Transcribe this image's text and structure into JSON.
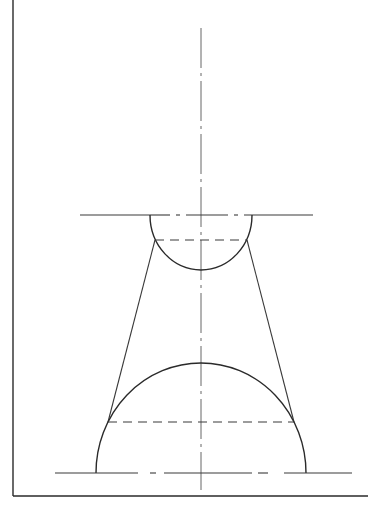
{
  "drawing": {
    "title": "",
    "type": "technical projection drawing - cone frustum tangent to two spheres",
    "colors": {
      "background": "#ffffff",
      "line": "#2a2a2a",
      "centerline": "#555555"
    },
    "frame": {
      "left_x": 13,
      "top_y": 0,
      "bottom_y": 496,
      "right_x": 368
    },
    "axis": {
      "x": 201,
      "y_top": 28,
      "y_bottom": 490,
      "style": "dash-dot"
    },
    "small_sphere": {
      "center_x": 201,
      "center_y": 215,
      "radius": 51,
      "visible": "lower semicircle",
      "base_line": {
        "x1": 80,
        "x2": 313,
        "y": 215,
        "style": "solid ends, dash-dot middle"
      },
      "tangent_chord": {
        "x1": 155,
        "x2": 247,
        "y": 240,
        "style": "dashed"
      }
    },
    "large_sphere": {
      "center_x": 201,
      "center_y": 473,
      "radius": 105,
      "visible": "upper semicircle",
      "base_line": {
        "x1": 55,
        "x2": 352,
        "y": 473,
        "style": "solid ends, dash-dot middle"
      },
      "tangent_chord": {
        "x1": 108,
        "x2": 294,
        "y": 422,
        "style": "dashed"
      }
    },
    "cone_generators": [
      {
        "side": "left",
        "x1": 155,
        "y1": 240,
        "x2": 108,
        "y2": 422
      },
      {
        "side": "right",
        "x1": 247,
        "y1": 240,
        "x2": 294,
        "y2": 422
      }
    ]
  }
}
